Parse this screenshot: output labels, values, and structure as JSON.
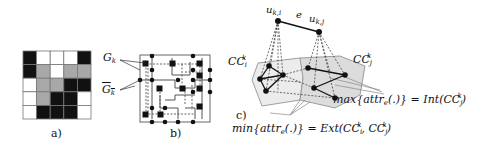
{
  "figure": {
    "panels": [
      {
        "id": "a",
        "label": "a)"
      },
      {
        "id": "b",
        "label": "b)"
      },
      {
        "id": "c",
        "label": "c)"
      }
    ],
    "panel_a": {
      "grid_rows": 5,
      "grid_cols": 5,
      "cells": [
        [
          "black",
          "white",
          "white",
          "white",
          "black"
        ],
        [
          "black",
          "gray",
          "white",
          "gray",
          "gray"
        ],
        [
          "white",
          "gray",
          "gray",
          "black",
          "black"
        ],
        [
          "white",
          "gray",
          "black",
          "black",
          "white"
        ],
        [
          "white",
          "black",
          "black",
          "black",
          "white"
        ]
      ],
      "colors": {
        "black": "#111111",
        "gray": "#a8a8a8",
        "white": "#ffffff",
        "grid": "#777777"
      }
    },
    "panel_b": {
      "label_graph": "G",
      "label_graph_sub": "k",
      "label_complement": "G",
      "label_complement_sub": "k"
    },
    "panel_c": {
      "node_i": {
        "base": "u",
        "sub": "k,i"
      },
      "node_j": {
        "base": "u",
        "sub": "k,j"
      },
      "edge_label": "e",
      "component_i": {
        "base": "CC",
        "sub": "i",
        "sup": "k"
      },
      "component_j": {
        "base": "CC",
        "sub": "j",
        "sup": "k"
      },
      "max_formula": "max{attr",
      "max_formula_sub": "e",
      "max_formula_rest": "(.)} = Int(CC",
      "max_formula_sub2": "j",
      "max_formula_sup2": "k",
      "max_formula_end": ")",
      "min_formula": "min{attr",
      "min_formula_sub": "e",
      "min_formula_rest": "(.)} = Ext(CC",
      "min_formula_sub2": "i",
      "min_formula_sup2": "k",
      "min_formula_mid": ", CC",
      "min_formula_sub3": "j",
      "min_formula_sup3": "k",
      "min_formula_end": ")"
    }
  }
}
